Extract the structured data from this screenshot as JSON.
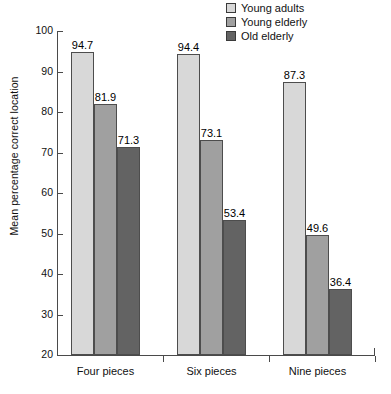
{
  "chart_data": {
    "type": "bar",
    "title": "",
    "xlabel": "",
    "ylabel": "Mean percentage correct location",
    "ylim": [
      20,
      100
    ],
    "yticks": [
      20,
      30,
      40,
      50,
      60,
      70,
      80,
      90,
      100
    ],
    "grid": false,
    "legend_position": "top-right",
    "categories": [
      "Four pieces",
      "Six pieces",
      "Nine pieces"
    ],
    "series": [
      {
        "name": "Young adults",
        "color": "#d8d8d8",
        "values": [
          94.7,
          94.4,
          87.3
        ]
      },
      {
        "name": "Young elderly",
        "color": "#a0a0a0",
        "values": [
          81.9,
          73.1,
          49.6
        ]
      },
      {
        "name": "Old elderly",
        "color": "#636363",
        "values": [
          71.3,
          53.4,
          36.4
        ]
      }
    ]
  }
}
